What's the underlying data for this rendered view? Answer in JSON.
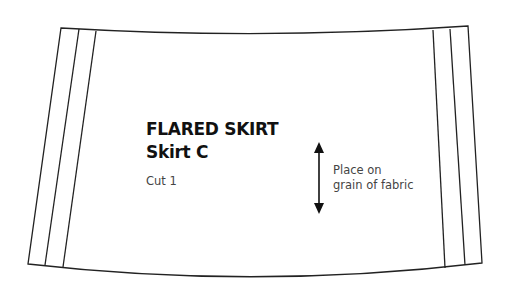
{
  "pattern_piece": {
    "title": "FLARED SKIRT",
    "subtitle": "Skirt C",
    "cut_instruction": "Cut 1",
    "grainline": {
      "line1": "Place on",
      "line2": "grain of fabric",
      "icon": "double-arrow-vertical"
    }
  }
}
